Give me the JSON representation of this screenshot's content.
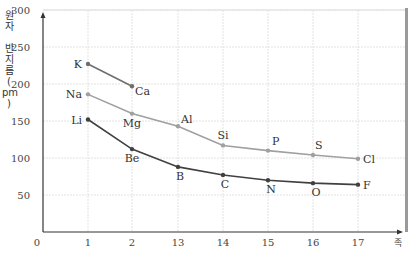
{
  "chart_data": {
    "type": "line",
    "title": "",
    "ylabel": "원자 반지름(pm)",
    "xlabel": "족",
    "categories": [
      "1",
      "2",
      "13",
      "14",
      "15",
      "16",
      "17"
    ],
    "x_origin_label": "0",
    "yticks": [
      50,
      100,
      150,
      200,
      250,
      300
    ],
    "ylim": [
      0,
      300
    ],
    "grid": true,
    "series": [
      {
        "name": "Period 4",
        "color": "#6e6e6e",
        "points": [
          {
            "group": "1",
            "element": "K",
            "value": 227
          },
          {
            "group": "2",
            "element": "Ca",
            "value": 197
          }
        ]
      },
      {
        "name": "Period 3",
        "color": "#a0a0a0",
        "points": [
          {
            "group": "1",
            "element": "Na",
            "value": 186
          },
          {
            "group": "2",
            "element": "Mg",
            "value": 160
          },
          {
            "group": "13",
            "element": "Al",
            "value": 143
          },
          {
            "group": "14",
            "element": "Si",
            "value": 117
          },
          {
            "group": "15",
            "element": "P",
            "value": 110
          },
          {
            "group": "16",
            "element": "S",
            "value": 104
          },
          {
            "group": "17",
            "element": "Cl",
            "value": 99
          }
        ]
      },
      {
        "name": "Period 2",
        "color": "#404040",
        "points": [
          {
            "group": "1",
            "element": "Li",
            "value": 152
          },
          {
            "group": "2",
            "element": "Be",
            "value": 112
          },
          {
            "group": "13",
            "element": "B",
            "value": 88
          },
          {
            "group": "14",
            "element": "C",
            "value": 77
          },
          {
            "group": "15",
            "element": "N",
            "value": 70
          },
          {
            "group": "16",
            "element": "O",
            "value": 66
          },
          {
            "group": "17",
            "element": "F",
            "value": 64
          }
        ]
      }
    ]
  }
}
